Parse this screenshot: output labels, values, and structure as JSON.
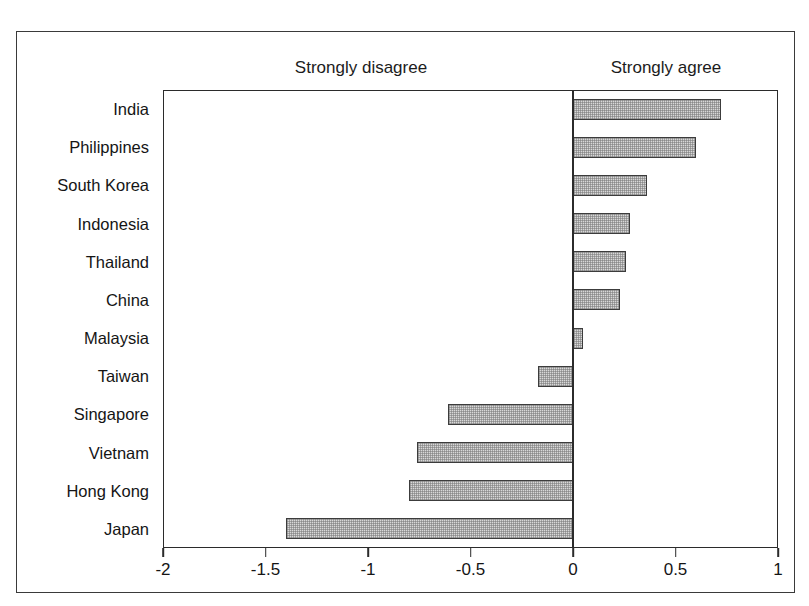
{
  "figure": {
    "caption_sliver": "",
    "headings": {
      "left": "Strongly disagree",
      "right": "Strongly agree"
    }
  },
  "chart_data": {
    "type": "bar",
    "orientation": "horizontal",
    "title": "",
    "subtitle": "",
    "xlabel": "",
    "ylabel": "",
    "xlim": [
      -2,
      1
    ],
    "ylim": null,
    "grid": false,
    "legend": null,
    "xticks": [
      -2,
      -1.5,
      -1,
      -0.5,
      0,
      0.5,
      1
    ],
    "xticklabels": [
      "-2",
      "-1.5",
      "-1",
      "-0.5",
      "0",
      "0.5",
      "1"
    ],
    "annotations": [
      {
        "text": "Strongly disagree",
        "side": "left"
      },
      {
        "text": "Strongly agree",
        "side": "right"
      }
    ],
    "zero_reference": 0,
    "categories": [
      "India",
      "Philippines",
      "South Korea",
      "Indonesia",
      "Thailand",
      "China",
      "Malaysia",
      "Taiwan",
      "Singapore",
      "Vietnam",
      "Hong Kong",
      "Japan"
    ],
    "values": [
      0.72,
      0.6,
      0.36,
      0.28,
      0.26,
      0.23,
      0.05,
      -0.17,
      -0.61,
      -0.76,
      -0.8,
      -1.4
    ],
    "bar_fill_color": "#d8d8d8",
    "bar_edge_color": "#3c3c3c",
    "axis_color": "#2b2b2b",
    "background_color": "#ffffff"
  }
}
